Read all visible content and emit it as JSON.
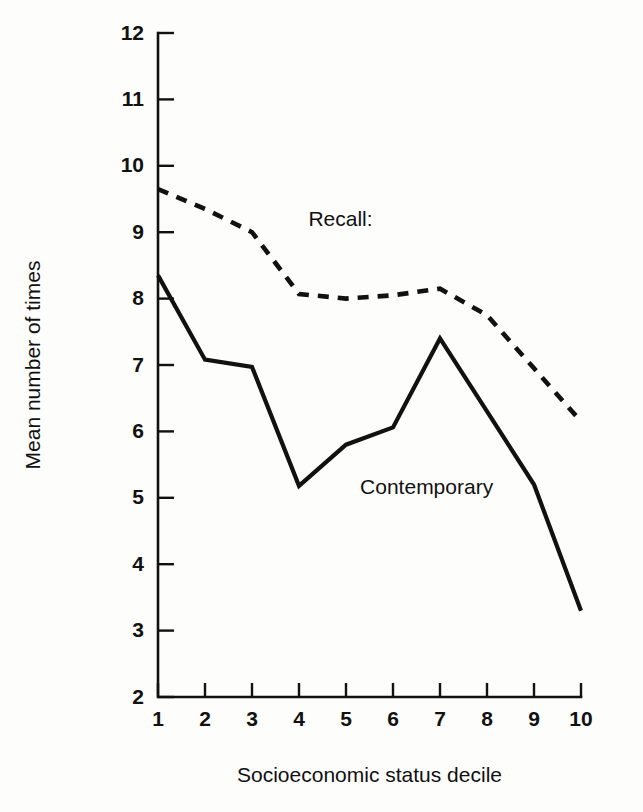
{
  "chart_data": {
    "type": "line",
    "title": "",
    "xlabel": "Socioeconomic status decile",
    "ylabel": "Mean number of times",
    "x": [
      1,
      2,
      3,
      4,
      5,
      6,
      7,
      8,
      9,
      10
    ],
    "xtick_labels": [
      "1",
      "2",
      "3",
      "4",
      "5",
      "6",
      "7",
      "8",
      "9",
      "10"
    ],
    "ytick_labels": [
      "2",
      "3",
      "4",
      "5",
      "6",
      "7",
      "8",
      "9",
      "10",
      "11",
      "12"
    ],
    "yticks": [
      2,
      3,
      4,
      5,
      6,
      7,
      8,
      9,
      10,
      11,
      12
    ],
    "xlim": [
      1,
      10
    ],
    "ylim": [
      2,
      12
    ],
    "grid": false,
    "legend_position": "inline-annotation",
    "series": [
      {
        "name": "Recall:",
        "style": "dashed",
        "color": "#111111",
        "label_x": 4.2,
        "label_y": 9.1,
        "values": [
          9.65,
          9.35,
          9.0,
          8.07,
          8.0,
          8.05,
          8.15,
          7.75,
          6.95,
          6.15
        ]
      },
      {
        "name": "Contemporary",
        "style": "solid",
        "color": "#111111",
        "label_x": 5.3,
        "label_y": 5.05,
        "values": [
          8.35,
          7.08,
          6.97,
          5.18,
          5.8,
          6.06,
          7.4,
          6.3,
          5.2,
          3.3
        ]
      }
    ],
    "geometry": {
      "plot_left": 158,
      "plot_right": 581,
      "plot_top": 33,
      "plot_bottom": 697,
      "axis_x_origin": 110,
      "y_tick_length": 16,
      "x_tick_length": 14
    }
  }
}
